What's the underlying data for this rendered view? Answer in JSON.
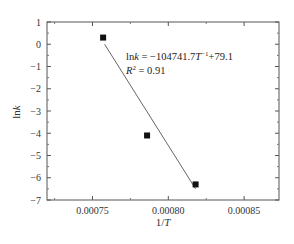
{
  "chart_data": {
    "type": "scatter",
    "title": "",
    "xlabel": "1/T",
    "ylabel": "lnk",
    "xlim": [
      0.00072,
      0.000873
    ],
    "ylim": [
      -7,
      1
    ],
    "x_ticks": [
      "0.00075",
      "0.00080",
      "0.00085"
    ],
    "y_ticks": [
      "1",
      "0",
      "-1",
      "-2",
      "-3",
      "-4",
      "-5",
      "-6",
      "-7"
    ],
    "grid": false,
    "series": [
      {
        "name": "data",
        "marker": "square",
        "x": [
          0.000757,
          0.000786,
          0.000818
        ],
        "y": [
          0.3,
          -4.1,
          -6.3
        ]
      },
      {
        "name": "linear fit",
        "type": "line",
        "x": [
          0.000758,
          0.000818
        ],
        "y": [
          0.0,
          -6.5
        ]
      }
    ],
    "annotations": {
      "equation": "lnk = −104741.7T⁻¹+79.1",
      "r_squared": "R² = 0.91"
    }
  }
}
